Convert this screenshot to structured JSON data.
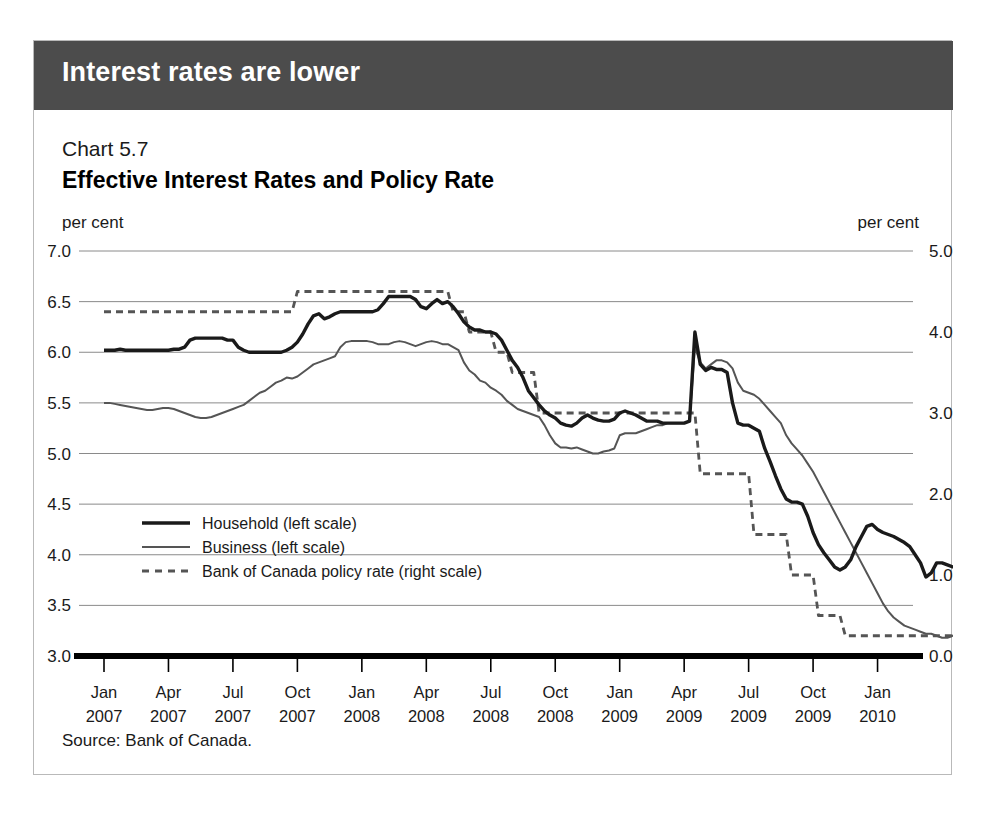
{
  "banner": {
    "title": "Interest rates are lower"
  },
  "header": {
    "chart_number": "Chart 5.7",
    "title": "Effective Interest Rates and Policy Rate",
    "unit_left": "per cent",
    "unit_right": "per cent"
  },
  "source": {
    "text": "Source: Bank of Canada."
  },
  "colors": {
    "banner_bg": "#4c4c4c",
    "household": "#1a1a1a",
    "business": "#555555",
    "policy": "#555555",
    "gridline": "#8a8a8a",
    "axis": "#000000",
    "card_border": "#b9b9b9"
  },
  "chart_data": {
    "type": "line",
    "title": "Effective Interest Rates and Policy Rate",
    "subtitle": "Chart 5.7",
    "xlabel": "",
    "ylabel": "per cent",
    "y2label": "per cent",
    "ylim": [
      3.0,
      7.0
    ],
    "y2lim": [
      0.0,
      5.0
    ],
    "yticks": [
      "3.0",
      "3.5",
      "4.0",
      "4.5",
      "5.0",
      "5.5",
      "6.0",
      "6.5",
      "7.0"
    ],
    "y2ticks": [
      "0.0",
      "1.0",
      "2.0",
      "3.0",
      "4.0",
      "5.0"
    ],
    "grid": true,
    "legend_position": "inner-left",
    "xtick_labels": [
      {
        "month": "Jan",
        "year": "2007"
      },
      {
        "month": "Apr",
        "year": "2007"
      },
      {
        "month": "Jul",
        "year": "2007"
      },
      {
        "month": "Oct",
        "year": "2007"
      },
      {
        "month": "Jan",
        "year": "2008"
      },
      {
        "month": "Apr",
        "year": "2008"
      },
      {
        "month": "Jul",
        "year": "2008"
      },
      {
        "month": "Oct",
        "year": "2008"
      },
      {
        "month": "Jan",
        "year": "2009"
      },
      {
        "month": "Apr",
        "year": "2009"
      },
      {
        "month": "Jul",
        "year": "2009"
      },
      {
        "month": "Oct",
        "year": "2009"
      },
      {
        "month": "Jan",
        "year": "2010"
      }
    ],
    "x_start": "2007-01",
    "x_end": "2010-02",
    "series": [
      {
        "name": "Household (left scale)",
        "axis": "left",
        "style": "solid-thick",
        "values": [
          6.02,
          6.02,
          6.02,
          6.03,
          6.02,
          6.02,
          6.02,
          6.02,
          6.02,
          6.02,
          6.02,
          6.02,
          6.02,
          6.03,
          6.03,
          6.05,
          6.12,
          6.14,
          6.14,
          6.14,
          6.14,
          6.14,
          6.14,
          6.12,
          6.12,
          6.05,
          6.02,
          6.0,
          6.0,
          6.0,
          6.0,
          6.0,
          6.0,
          6.0,
          6.02,
          6.05,
          6.1,
          6.18,
          6.28,
          6.36,
          6.38,
          6.33,
          6.35,
          6.38,
          6.4,
          6.4,
          6.4,
          6.4,
          6.4,
          6.4,
          6.4,
          6.42,
          6.48,
          6.55,
          6.55,
          6.55,
          6.55,
          6.55,
          6.52,
          6.45,
          6.43,
          6.48,
          6.52,
          6.48,
          6.5,
          6.45,
          6.38,
          6.3,
          6.25,
          6.22,
          6.22,
          6.2,
          6.2,
          6.18,
          6.12,
          6.02,
          5.92,
          5.85,
          5.75,
          5.62,
          5.55,
          5.48,
          5.42,
          5.38,
          5.35,
          5.3,
          5.28,
          5.27,
          5.3,
          5.35,
          5.38,
          5.35,
          5.33,
          5.32,
          5.32,
          5.34,
          5.4,
          5.42,
          5.4,
          5.38,
          5.35,
          5.32,
          5.32,
          5.32,
          5.3,
          5.3,
          5.3,
          5.3,
          5.3,
          5.32,
          6.2,
          5.88,
          5.82,
          5.85,
          5.83,
          5.83,
          5.8,
          5.5,
          5.3,
          5.28,
          5.28,
          5.25,
          5.22,
          5.05,
          4.92,
          4.78,
          4.65,
          4.55,
          4.52,
          4.52,
          4.5,
          4.38,
          4.22,
          4.1,
          4.02,
          3.95,
          3.88,
          3.85,
          3.88,
          3.95,
          4.08,
          4.18,
          4.28,
          4.3,
          4.25,
          4.22,
          4.2,
          4.18,
          4.15,
          4.12,
          4.08,
          4.0,
          3.92,
          3.78,
          3.82,
          3.92,
          3.92,
          3.9,
          3.88,
          3.88,
          3.8,
          3.78,
          3.78,
          3.78,
          3.78,
          3.78,
          3.77,
          3.77
        ]
      },
      {
        "name": "Business (left scale)",
        "axis": "left",
        "style": "solid-thin",
        "values": [
          5.5,
          5.5,
          5.49,
          5.48,
          5.47,
          5.46,
          5.45,
          5.44,
          5.43,
          5.43,
          5.44,
          5.45,
          5.45,
          5.44,
          5.42,
          5.4,
          5.38,
          5.36,
          5.35,
          5.35,
          5.36,
          5.38,
          5.4,
          5.42,
          5.44,
          5.46,
          5.48,
          5.52,
          5.56,
          5.6,
          5.62,
          5.66,
          5.7,
          5.72,
          5.75,
          5.74,
          5.76,
          5.8,
          5.84,
          5.88,
          5.9,
          5.92,
          5.94,
          5.96,
          6.05,
          6.1,
          6.11,
          6.11,
          6.11,
          6.11,
          6.1,
          6.08,
          6.08,
          6.08,
          6.1,
          6.11,
          6.1,
          6.08,
          6.06,
          6.08,
          6.1,
          6.11,
          6.1,
          6.08,
          6.08,
          6.05,
          6.02,
          5.9,
          5.82,
          5.78,
          5.72,
          5.7,
          5.65,
          5.62,
          5.58,
          5.52,
          5.48,
          5.44,
          5.42,
          5.4,
          5.38,
          5.36,
          5.28,
          5.18,
          5.1,
          5.06,
          5.06,
          5.05,
          5.06,
          5.04,
          5.02,
          5.0,
          5.0,
          5.02,
          5.03,
          5.05,
          5.18,
          5.2,
          5.2,
          5.2,
          5.22,
          5.24,
          5.26,
          5.28,
          5.28,
          5.3,
          5.3,
          5.3,
          5.3,
          5.32,
          6.05,
          5.9,
          5.84,
          5.88,
          5.92,
          5.92,
          5.9,
          5.84,
          5.7,
          5.62,
          5.6,
          5.58,
          5.54,
          5.48,
          5.42,
          5.36,
          5.3,
          5.18,
          5.1,
          5.04,
          4.98,
          4.9,
          4.82,
          4.72,
          4.62,
          4.52,
          4.42,
          4.32,
          4.22,
          4.12,
          4.02,
          3.92,
          3.82,
          3.72,
          3.62,
          3.52,
          3.44,
          3.38,
          3.34,
          3.3,
          3.28,
          3.26,
          3.24,
          3.22,
          3.22,
          3.2,
          3.18,
          3.18,
          3.2,
          3.22,
          3.24,
          3.22,
          3.18,
          3.16,
          3.14,
          3.14,
          3.16,
          3.16
        ]
      },
      {
        "name": "Bank of Canada policy rate (right scale)",
        "axis": "right",
        "style": "dashed",
        "values": [
          4.25,
          4.25,
          4.25,
          4.25,
          4.25,
          4.25,
          4.25,
          4.25,
          4.25,
          4.25,
          4.25,
          4.25,
          4.25,
          4.25,
          4.25,
          4.25,
          4.25,
          4.25,
          4.25,
          4.25,
          4.25,
          4.25,
          4.25,
          4.25,
          4.25,
          4.25,
          4.25,
          4.25,
          4.25,
          4.25,
          4.25,
          4.25,
          4.25,
          4.25,
          4.25,
          4.25,
          4.5,
          4.5,
          4.5,
          4.5,
          4.5,
          4.5,
          4.5,
          4.5,
          4.5,
          4.5,
          4.5,
          4.5,
          4.5,
          4.5,
          4.5,
          4.5,
          4.5,
          4.5,
          4.5,
          4.5,
          4.5,
          4.5,
          4.5,
          4.5,
          4.5,
          4.5,
          4.5,
          4.5,
          4.5,
          4.25,
          4.25,
          4.25,
          4.0,
          4.0,
          4.0,
          4.0,
          4.0,
          3.75,
          3.75,
          3.75,
          3.5,
          3.5,
          3.5,
          3.5,
          3.5,
          3.0,
          3.0,
          3.0,
          3.0,
          3.0,
          3.0,
          3.0,
          3.0,
          3.0,
          3.0,
          3.0,
          3.0,
          3.0,
          3.0,
          3.0,
          3.0,
          3.0,
          3.0,
          3.0,
          3.0,
          3.0,
          3.0,
          3.0,
          3.0,
          3.0,
          3.0,
          3.0,
          3.0,
          3.0,
          3.0,
          2.25,
          2.25,
          2.25,
          2.25,
          2.25,
          2.25,
          2.25,
          2.25,
          2.25,
          2.25,
          1.5,
          1.5,
          1.5,
          1.5,
          1.5,
          1.5,
          1.5,
          1.0,
          1.0,
          1.0,
          1.0,
          1.0,
          0.5,
          0.5,
          0.5,
          0.5,
          0.5,
          0.25,
          0.25,
          0.25,
          0.25,
          0.25,
          0.25,
          0.25,
          0.25,
          0.25,
          0.25,
          0.25,
          0.25,
          0.25,
          0.25,
          0.25,
          0.25,
          0.25,
          0.25,
          0.25,
          0.25,
          0.25,
          0.25,
          0.25,
          0.25,
          0.25,
          0.25,
          0.25,
          0.25,
          0.25,
          0.25
        ]
      }
    ]
  }
}
